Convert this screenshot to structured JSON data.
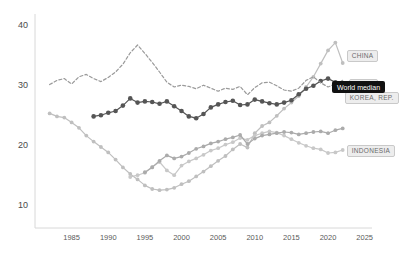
{
  "chart_data": {
    "type": "line",
    "title": "",
    "subtitle": "",
    "xlabel": "",
    "ylabel": "",
    "xlim": [
      1980,
      2026
    ],
    "ylim": [
      7,
      41
    ],
    "xticks": [
      1985,
      1990,
      1995,
      2000,
      2005,
      2010,
      2015,
      2020,
      2025
    ],
    "yticks": [
      10,
      20,
      30,
      40
    ],
    "grid": false,
    "legend_position": "right-end-labels",
    "series": [
      {
        "name": "CHINA",
        "style": "solid",
        "color": "#bfbfbf",
        "marker": "circle",
        "x": [
          1982,
          1983,
          1984,
          1985,
          1986,
          1987,
          1988,
          1989,
          1990,
          1991,
          1992,
          1993,
          1994,
          1995,
          1996,
          1997,
          1998,
          1999,
          2000,
          2001,
          2002,
          2003,
          2004,
          2005,
          2006,
          2007,
          2008,
          2009,
          2010,
          2011,
          2012,
          2013,
          2014,
          2015,
          2016,
          2017,
          2018,
          2019,
          2020,
          2021,
          2022
        ],
        "y": [
          25.1,
          24.6,
          24.4,
          23.6,
          22.7,
          21.4,
          20.4,
          19.5,
          18.6,
          17.4,
          16.1,
          15.0,
          14.1,
          13.1,
          12.5,
          12.3,
          12.4,
          12.7,
          13.3,
          13.8,
          14.6,
          15.4,
          16.3,
          17.2,
          18.0,
          19.1,
          20.0,
          19.4,
          21.8,
          23.0,
          23.6,
          24.7,
          25.9,
          26.9,
          28.0,
          29.5,
          31.2,
          33.4,
          35.6,
          36.9,
          33.5
        ]
      },
      {
        "name": "INDIA",
        "style": "solid",
        "color": "#555555",
        "marker": "circle",
        "x": [
          1988,
          1989,
          1990,
          1991,
          1992,
          1993,
          1994,
          1995,
          1996,
          1997,
          1998,
          1999,
          2000,
          2001,
          2002,
          2003,
          2004,
          2005,
          2006,
          2007,
          2008,
          2009,
          2010,
          2011,
          2012,
          2013,
          2014,
          2015,
          2016,
          2017,
          2018,
          2019,
          2020,
          2021,
          2022
        ],
        "y": [
          24.6,
          24.8,
          25.2,
          25.5,
          26.4,
          27.6,
          26.9,
          27.1,
          27.0,
          26.7,
          27.1,
          26.3,
          25.5,
          24.6,
          24.3,
          25.0,
          26.1,
          26.6,
          27.0,
          27.2,
          26.5,
          26.6,
          27.4,
          27.1,
          26.8,
          26.6,
          26.9,
          27.3,
          28.3,
          29.2,
          29.7,
          30.5,
          30.9,
          30.3,
          29.8
        ]
      },
      {
        "name": "KOREA, REP.",
        "style": "dashed",
        "color": "#9a9a9a",
        "marker": "none",
        "x": [
          1982,
          1983,
          1984,
          1985,
          1986,
          1987,
          1988,
          1989,
          1990,
          1991,
          1992,
          1993,
          1994,
          1995,
          1996,
          1997,
          1998,
          1999,
          2000,
          2001,
          2002,
          2003,
          2004,
          2005,
          2006,
          2007,
          2008,
          2009,
          2010,
          2011,
          2012,
          2013,
          2014,
          2015,
          2016,
          2017,
          2018,
          2019,
          2020,
          2021,
          2022
        ],
        "y": [
          29.9,
          30.6,
          30.9,
          30.0,
          31.2,
          31.6,
          30.9,
          30.4,
          31.1,
          32.0,
          33.3,
          35.2,
          36.5,
          35.1,
          33.6,
          32.0,
          30.3,
          29.5,
          29.8,
          29.6,
          29.2,
          29.8,
          29.3,
          28.8,
          29.3,
          29.1,
          29.6,
          28.2,
          29.4,
          30.2,
          30.3,
          29.7,
          29.0,
          28.8,
          29.3,
          30.6,
          31.2,
          30.2,
          29.5,
          30.0,
          30.6
        ]
      },
      {
        "name": "INDONESIA",
        "style": "solid",
        "color": "#c8c8c8",
        "marker": "circle",
        "x": [
          1993,
          1994,
          1995,
          1996,
          1997,
          1998,
          1999,
          2000,
          2001,
          2002,
          2003,
          2004,
          2005,
          2006,
          2007,
          2008,
          2009,
          2010,
          2011,
          2012,
          2013,
          2014,
          2015,
          2016,
          2017,
          2018,
          2019,
          2020,
          2021,
          2022
        ],
        "y": [
          14.5,
          14.8,
          15.2,
          16.2,
          17.0,
          15.6,
          14.8,
          16.4,
          17.1,
          17.6,
          18.2,
          18.9,
          19.3,
          19.9,
          20.3,
          21.0,
          20.7,
          21.4,
          21.8,
          22.1,
          21.9,
          21.4,
          20.8,
          20.2,
          19.7,
          19.3,
          19.1,
          18.5,
          18.6,
          19.0
        ]
      },
      {
        "name": "WORLD",
        "style": "solid",
        "color": "#ababab",
        "marker": "circle",
        "x": [
          1995,
          1996,
          1997,
          1998,
          1999,
          2000,
          2001,
          2002,
          2003,
          2004,
          2005,
          2006,
          2007,
          2008,
          2009,
          2010,
          2011,
          2012,
          2013,
          2014,
          2015,
          2016,
          2017,
          2018,
          2019,
          2020,
          2021,
          2022
        ],
        "y": [
          15.3,
          16.1,
          17.2,
          18.1,
          17.6,
          17.9,
          18.5,
          19.2,
          19.6,
          20.1,
          20.4,
          20.8,
          21.1,
          21.5,
          20.0,
          20.9,
          21.4,
          21.6,
          21.8,
          22.0,
          21.9,
          21.6,
          21.8,
          22.0,
          22.1,
          21.8,
          22.3,
          22.6
        ]
      }
    ],
    "end_labels": [
      {
        "text": "CHINA",
        "series": "CHINA"
      },
      {
        "text": "INDIA",
        "series": "INDIA"
      },
      {
        "text": "KOREA, REP.",
        "series": "KOREA, REP."
      },
      {
        "text": "INDONESIA",
        "series": "INDONESIA"
      }
    ],
    "tooltip": {
      "text": "World median"
    }
  }
}
